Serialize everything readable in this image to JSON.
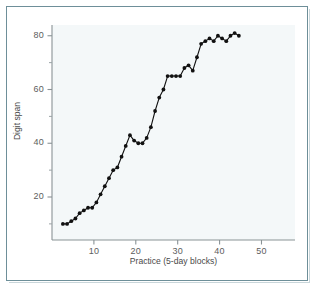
{
  "figure": {
    "frame_color": "#6e8f99",
    "plot_background": "#f4f8f9",
    "page_background": "#ffffff"
  },
  "chart_data": {
    "type": "line",
    "title": "",
    "subtitle": "",
    "xlabel": "Practice (5-day blocks)",
    "ylabel": "Digit span",
    "xlim": [
      0,
      58
    ],
    "ylim": [
      4,
      84
    ],
    "grid": false,
    "legend": null,
    "marker": "filled-circle",
    "marker_color": "#111111",
    "line_color": "#111111",
    "x_major_ticks": [
      10,
      20,
      30,
      40,
      50
    ],
    "x_tick_labels": [
      "10",
      "20",
      "30",
      "40",
      "50"
    ],
    "y_major_ticks": [
      20,
      40,
      60,
      80
    ],
    "y_tick_labels": [
      "20",
      "40",
      "60",
      "80"
    ],
    "y_minor_ticks": [
      10,
      30,
      50,
      70
    ],
    "series": [
      {
        "name": "Digit span",
        "x": [
          2.6,
          3.6,
          4.6,
          5.6,
          6.6,
          7.6,
          8.6,
          9.6,
          10.6,
          11.6,
          12.6,
          13.6,
          14.6,
          15.6,
          16.6,
          17.6,
          18.6,
          19.6,
          20.6,
          21.6,
          22.6,
          23.6,
          24.6,
          25.6,
          26.6,
          27.6,
          28.6,
          29.6,
          30.6,
          31.6,
          32.6,
          33.6,
          34.6,
          35.6,
          36.6,
          37.6,
          38.6,
          39.6,
          40.6,
          41.6,
          42.6,
          43.6,
          44.6
        ],
        "y": [
          10,
          10,
          11,
          12,
          14,
          15,
          16,
          16,
          18,
          21,
          24,
          27,
          30,
          31,
          35,
          39,
          43,
          41,
          40,
          40,
          42,
          46,
          52,
          57,
          60,
          65,
          65,
          65,
          65,
          68,
          69,
          67,
          72,
          77,
          78,
          79,
          78,
          80,
          79,
          78,
          80,
          81,
          80
        ]
      }
    ],
    "n_points": 43
  }
}
